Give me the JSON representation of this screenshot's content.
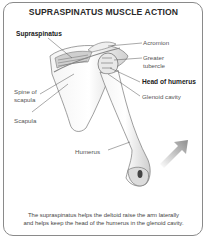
{
  "title": "SUPRASPINATUS MUSCLE ACTION",
  "labels": {
    "supraspinatus": "Supraspinatus",
    "acromion": "Acromion",
    "greater_tubercle_line1": "Greater",
    "greater_tubercle_line2": "tubercle",
    "head_of_humerus": "Head of humerus",
    "glenoid_cavity": "Glenoid cavity",
    "spine_of_scapula_line1": "Spine of",
    "spine_of_scapula_line2": "scapula",
    "scapula": "Scapula",
    "humerus": "Humerus"
  },
  "caption": {
    "line1": "The supraspinatus helps the deltoid raise the arm laterally",
    "line2": "and helps keep the head of the humerus in the glenoid cavity."
  },
  "arrow": {
    "direction": "up-right",
    "color": "#9a9a9a"
  }
}
